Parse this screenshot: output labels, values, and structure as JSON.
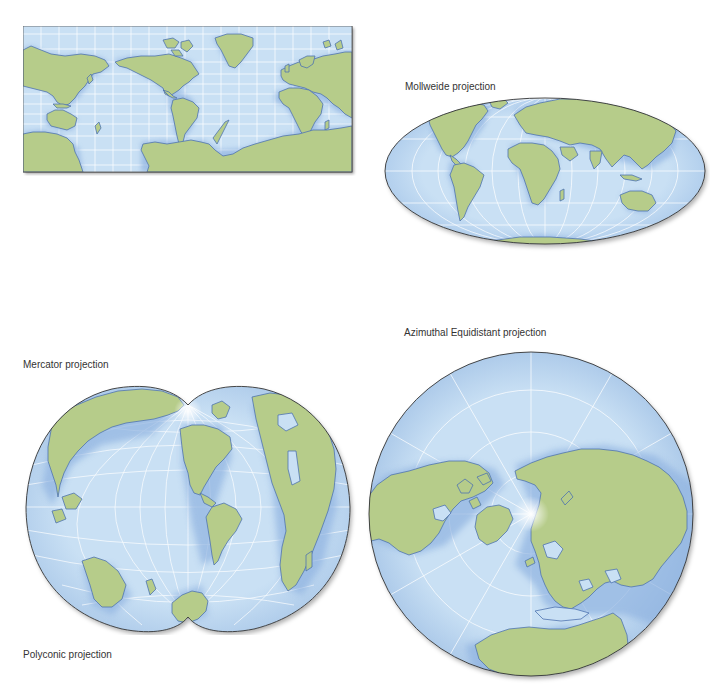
{
  "figure": {
    "maps": [
      {
        "id": "mercator",
        "caption": "Mercator projection"
      },
      {
        "id": "mollweide",
        "caption": "Mollweide projection"
      },
      {
        "id": "azimuthal",
        "caption": "Azimuthal Equidistant projection"
      },
      {
        "id": "polyconic",
        "caption": "Polyconic projection"
      }
    ]
  },
  "colors": {
    "ocean": "#c9e0f4",
    "ocean_edge": "#a9c8ea",
    "land": "#b6cc8a",
    "coast": "#4f74b0",
    "graticule": "#ffffff",
    "outline": "#333333",
    "caption": "#333333"
  }
}
